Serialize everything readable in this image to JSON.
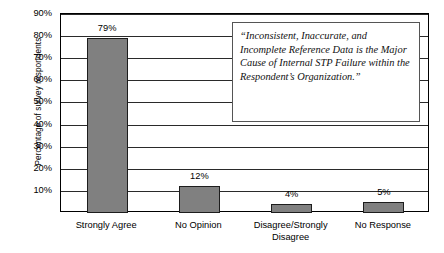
{
  "chart_data": {
    "type": "bar",
    "title": "",
    "xlabel": "",
    "ylabel": "Percentage of survey respondents",
    "categories": [
      "Strongly Agree",
      "No Opinion",
      "Disagree/Strongly Disagree",
      "No Response"
    ],
    "values": [
      79,
      12,
      4,
      5
    ],
    "data_labels": [
      "79%",
      "12%",
      "4%",
      "5%"
    ],
    "ylim": [
      0,
      90
    ],
    "yticks": [
      10,
      20,
      30,
      40,
      50,
      60,
      70,
      80,
      90
    ],
    "ytick_labels": [
      "10%",
      "20%",
      "30%",
      "40%",
      "50%",
      "60%",
      "70%",
      "80%",
      "90%"
    ],
    "grid": true,
    "legend": "none",
    "bar_color": "#808080",
    "bar_border_color": "#1d1d1d",
    "annotation": "“Inconsistent, Inaccurate, and Incomplete Reference Data is the Major Cause of Internal STP Failure within the Respondent’s Organization.”"
  },
  "axis": {
    "y_title": "Percentage of survey respondents",
    "ticks": [
      "90%",
      "80%",
      "70%",
      "60%",
      "50%",
      "40%",
      "30%",
      "20%",
      "10%"
    ]
  },
  "categories": [
    {
      "line1": "Strongly Agree",
      "line2": ""
    },
    {
      "line1": "No Opinion",
      "line2": ""
    },
    {
      "line1": "Disagree/Strongly",
      "line2": "Disagree"
    },
    {
      "line1": "No Response",
      "line2": ""
    }
  ],
  "bars": [
    {
      "label": "79%",
      "value": 79
    },
    {
      "label": "12%",
      "value": 12
    },
    {
      "label": "4%",
      "value": 4
    },
    {
      "label": "5%",
      "value": 5
    }
  ],
  "callout": {
    "text": "“Inconsistent, Inaccurate, and Incomplete Reference Data is the Major Cause of Internal STP Failure within the Respondent’s Organization.”"
  }
}
